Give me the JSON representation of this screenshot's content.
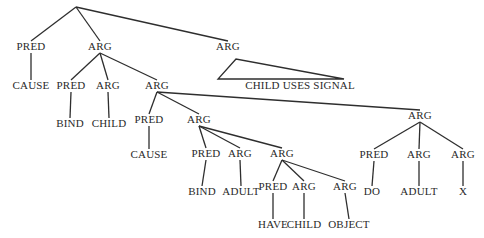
{
  "diagram": {
    "type": "tree",
    "root": {
      "id": "root",
      "label": "",
      "x": 76,
      "y": 7
    },
    "nodes": [
      {
        "id": "n1",
        "parent": "root",
        "label": "PRED",
        "x": 31,
        "y": 50
      },
      {
        "id": "n2",
        "parent": "root",
        "label": "ARG",
        "x": 100,
        "y": 50
      },
      {
        "id": "n3",
        "parent": "root",
        "label": "ARG",
        "x": 228,
        "y": 50
      },
      {
        "id": "n4",
        "parent": "n1",
        "label": "CAUSE",
        "x": 31,
        "y": 89
      },
      {
        "id": "n5",
        "parent": "n3",
        "label": "CHILD USES SIGNAL",
        "x": 300,
        "y": 89,
        "triangle": true
      },
      {
        "id": "n6",
        "parent": "n2",
        "label": "PRED",
        "x": 71,
        "y": 89
      },
      {
        "id": "n7",
        "parent": "n2",
        "label": "ARG",
        "x": 108,
        "y": 89
      },
      {
        "id": "n8",
        "parent": "n2",
        "label": "ARG",
        "x": 157,
        "y": 89
      },
      {
        "id": "n9",
        "parent": "n6",
        "label": "BIND",
        "x": 70,
        "y": 127
      },
      {
        "id": "n10",
        "parent": "n7",
        "label": "CHILD",
        "x": 109,
        "y": 127
      },
      {
        "id": "n11",
        "parent": "n8",
        "label": "PRED",
        "x": 149,
        "y": 123
      },
      {
        "id": "n12",
        "parent": "n8",
        "label": "ARG",
        "x": 199,
        "y": 123
      },
      {
        "id": "n13",
        "parent": "n8",
        "label": "ARG",
        "x": 420,
        "y": 119
      },
      {
        "id": "n14",
        "parent": "n11",
        "label": "CAUSE",
        "x": 149,
        "y": 158
      },
      {
        "id": "n15",
        "parent": "n12",
        "label": "PRED",
        "x": 206,
        "y": 157
      },
      {
        "id": "n16",
        "parent": "n12",
        "label": "ARG",
        "x": 240,
        "y": 157
      },
      {
        "id": "n17",
        "parent": "n12",
        "label": "ARG",
        "x": 282,
        "y": 157
      },
      {
        "id": "n18",
        "parent": "n15",
        "label": "BIND",
        "x": 202,
        "y": 195
      },
      {
        "id": "n19",
        "parent": "n16",
        "label": "ADULT",
        "x": 241,
        "y": 195
      },
      {
        "id": "n20",
        "parent": "n17",
        "label": "PRED",
        "x": 273,
        "y": 190
      },
      {
        "id": "n21",
        "parent": "n17",
        "label": "ARG",
        "x": 304,
        "y": 190
      },
      {
        "id": "n22",
        "parent": "n17",
        "label": "ARG",
        "x": 345,
        "y": 190
      },
      {
        "id": "n23",
        "parent": "n20",
        "label": "HAVE",
        "x": 273,
        "y": 228
      },
      {
        "id": "n24",
        "parent": "n21",
        "label": "CHILD",
        "x": 304,
        "y": 228
      },
      {
        "id": "n25",
        "parent": "n22",
        "label": "OBJECT",
        "x": 349,
        "y": 228
      },
      {
        "id": "n26",
        "parent": "n13",
        "label": "PRED",
        "x": 374,
        "y": 158
      },
      {
        "id": "n27",
        "parent": "n13",
        "label": "ARG",
        "x": 419,
        "y": 158
      },
      {
        "id": "n28",
        "parent": "n13",
        "label": "ARG",
        "x": 463,
        "y": 158
      },
      {
        "id": "n29",
        "parent": "n26",
        "label": "DO",
        "x": 372,
        "y": 195
      },
      {
        "id": "n30",
        "parent": "n27",
        "label": "ADULT",
        "x": 419,
        "y": 195
      },
      {
        "id": "n31",
        "parent": "n28",
        "label": "X",
        "x": 463,
        "y": 195
      }
    ],
    "triangle": {
      "apex": [
        236,
        59
      ],
      "left": [
        218,
        79
      ],
      "right": [
        344,
        79
      ]
    }
  }
}
